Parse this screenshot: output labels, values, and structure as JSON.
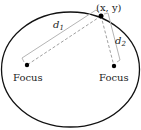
{
  "diagram": {
    "type": "ellipse-foci",
    "point_label": "(x, y)",
    "d1_label": "d",
    "d1_sub": "1",
    "d2_label": "d",
    "d2_sub": "2",
    "focus_left_label": "Focus",
    "focus_right_label": "Focus",
    "colors": {
      "ellipse": "#111111",
      "solid_bracket": "#b0b0b0",
      "dashed_line": "#a0a0a0",
      "point": "#000000"
    }
  }
}
